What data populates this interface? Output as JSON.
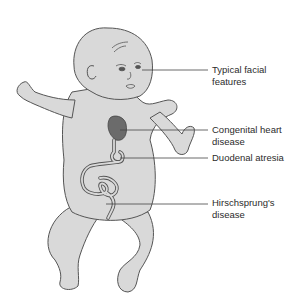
{
  "figure": {
    "colors": {
      "skin_fill": "#d9d9d9",
      "outline": "#555555",
      "heart_fill": "#6b6b6b",
      "leader_line": "#444444",
      "text": "#2b2b2b"
    },
    "labels": [
      {
        "id": "facial",
        "text": "Typical facial\nfeatures"
      },
      {
        "id": "heart",
        "text": "Congenital heart\ndisease"
      },
      {
        "id": "duodenal",
        "text": "Duodenal atresia"
      },
      {
        "id": "hirschsprung",
        "text": "Hirschsprung's\ndisease"
      }
    ]
  }
}
